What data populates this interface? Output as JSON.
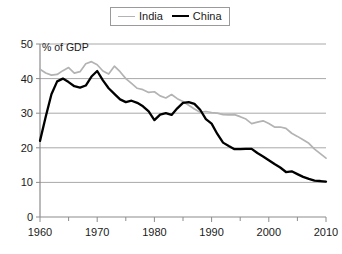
{
  "legend": {
    "position": "top-center",
    "entries": [
      {
        "label": "India",
        "color": "#b3b3b3",
        "icon": "line-swatch-icon"
      },
      {
        "label": "China",
        "color": "#000000",
        "icon": "line-swatch-icon"
      }
    ]
  },
  "annotation": {
    "text": "% of GDP"
  },
  "chart_data": {
    "type": "line",
    "title": "",
    "subtitle": "",
    "xlabel": "",
    "ylabel": "",
    "annotations": [
      "% of GDP"
    ],
    "grid": true,
    "legend_position": "top-center",
    "xlim": [
      1960,
      2010
    ],
    "ylim": [
      0,
      50
    ],
    "xticks": [
      1960,
      1970,
      1980,
      1990,
      2000,
      2010
    ],
    "xtick_labels": [
      "1960",
      "1970",
      "1980",
      "1990",
      "2000",
      "2010"
    ],
    "xminor_ticks": [
      1965,
      1975,
      1985,
      1995,
      2005
    ],
    "yticks": [
      0,
      10,
      20,
      30,
      40,
      50
    ],
    "ytick_labels": [
      "0",
      "10",
      "20",
      "30",
      "40",
      "50"
    ],
    "x": [
      1960,
      1961,
      1962,
      1963,
      1964,
      1965,
      1966,
      1967,
      1968,
      1969,
      1970,
      1971,
      1972,
      1973,
      1974,
      1975,
      1976,
      1977,
      1978,
      1979,
      1980,
      1981,
      1982,
      1983,
      1984,
      1985,
      1986,
      1987,
      1988,
      1989,
      1990,
      1991,
      1992,
      1993,
      1994,
      1995,
      1996,
      1997,
      1998,
      1999,
      2000,
      2001,
      2002,
      2003,
      2004,
      2005,
      2006,
      2007,
      2008,
      2009,
      2010
    ],
    "series": [
      {
        "name": "India",
        "color": "#b3b3b3",
        "values": [
          42.7,
          41.6,
          41.0,
          41.2,
          42.3,
          43.2,
          41.6,
          42.0,
          44.3,
          44.9,
          44.0,
          42.2,
          41.3,
          43.6,
          42.0,
          40.0,
          38.6,
          37.2,
          36.8,
          36.0,
          36.2,
          35.0,
          34.4,
          35.4,
          34.2,
          33.4,
          32.3,
          31.2,
          30.3,
          30.5,
          30.2,
          30.0,
          29.6,
          29.5,
          29.6,
          29.0,
          28.3,
          27.0,
          27.4,
          27.8,
          27.0,
          26.0,
          26.0,
          25.6,
          24.2,
          23.3,
          22.3,
          21.3,
          19.6,
          18.3,
          17.0
        ]
      },
      {
        "name": "China",
        "color": "#000000",
        "values": [
          22.0,
          29.0,
          35.5,
          39.2,
          40.0,
          39.0,
          37.8,
          37.4,
          38.0,
          40.6,
          42.2,
          39.5,
          37.2,
          35.6,
          34.0,
          33.2,
          33.6,
          33.0,
          32.0,
          30.5,
          28.0,
          29.6,
          30.0,
          29.5,
          31.4,
          33.0,
          33.2,
          32.7,
          31.0,
          28.3,
          27.0,
          24.0,
          21.5,
          20.5,
          19.6,
          19.6,
          19.7,
          19.7,
          18.5,
          17.5,
          16.4,
          15.3,
          14.3,
          13.0,
          13.2,
          12.4,
          11.6,
          11.0,
          10.5,
          10.4,
          10.2
        ]
      }
    ]
  }
}
